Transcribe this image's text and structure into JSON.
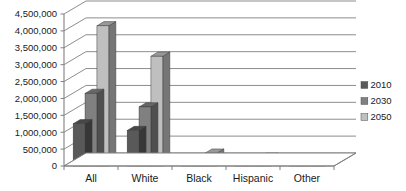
{
  "chart_data": {
    "type": "bar",
    "title": "",
    "subtitle": "",
    "xlabel": "",
    "ylabel": "",
    "categories": [
      "All",
      "White",
      "Black",
      "Hispanic",
      "Other"
    ],
    "series": [
      {
        "name": "2010",
        "color": "#595959",
        "values": [
          1250000,
          1050000,
          100000,
          60000,
          55000
        ]
      },
      {
        "name": "2030",
        "color": "#808080",
        "values": [
          2150000,
          1750000,
          170000,
          125000,
          110000
        ]
      },
      {
        "name": "2050",
        "color": "#bfbfbf",
        "values": [
          4150000,
          3250000,
          380000,
          260000,
          235000
        ]
      }
    ],
    "ylim": [
      0,
      4500000
    ],
    "ytick_values": [
      0,
      500000,
      1000000,
      1500000,
      2000000,
      2500000,
      3000000,
      3500000,
      4000000,
      4500000
    ],
    "ytick_labels": [
      "0",
      "500,000",
      "1,000,000",
      "1,500,000",
      "2,000,000",
      "2,500,000",
      "3,000,000",
      "3,500,000",
      "4,000,000",
      "4,500,000"
    ],
    "grid": true,
    "grid_axis": "y",
    "legend_position": "right",
    "style": "3d-clustered-column",
    "background": "#ffffff",
    "gridline_color": "#808080",
    "axis_color": "#808080"
  },
  "legend": {
    "entries": [
      {
        "label": "2010",
        "color": "#595959"
      },
      {
        "label": "2030",
        "color": "#808080"
      },
      {
        "label": "2050",
        "color": "#bfbfbf"
      }
    ]
  },
  "yaxis": {
    "labels": [
      "4,500,000",
      "4,000,000",
      "3,500,000",
      "3,000,000",
      "2,500,000",
      "2,000,000",
      "1,500,000",
      "1,000,000",
      "500,000",
      "0"
    ]
  },
  "xaxis": {
    "labels": [
      "All",
      "White",
      "Black",
      "Hispanic",
      "Other"
    ]
  }
}
